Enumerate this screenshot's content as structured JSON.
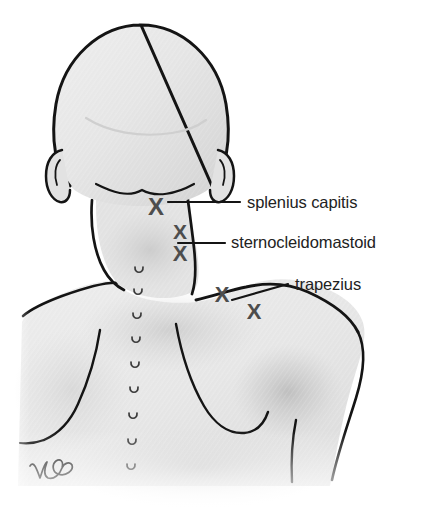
{
  "figure": {
    "view": "posterior",
    "background_color": "#ffffff",
    "skin_fill_light": "#f2f2f2",
    "skin_fill_mid": "#e4e4e4",
    "skin_fill_shadow": "#c9c9c9",
    "outline_color": "#141414",
    "marker_color": "#4d4d4d",
    "label_color": "#222222",
    "leader_color": "#141414"
  },
  "labels": [
    {
      "id": "splenius-capitis",
      "text": "splenius capitis",
      "x": 247,
      "y": 208,
      "leader": {
        "x1": 168,
        "y1": 202,
        "x2": 240,
        "y2": 202
      }
    },
    {
      "id": "sternocleidomastoid",
      "text": "sternocleidomastoid",
      "x": 231,
      "y": 248,
      "leader": {
        "x1": 178,
        "y1": 243,
        "x2": 225,
        "y2": 243
      }
    },
    {
      "id": "trapezius",
      "text": "trapezius",
      "x": 295,
      "y": 290,
      "leader": {
        "x1": 232,
        "y1": 300,
        "x2": 288,
        "y2": 284
      }
    }
  ],
  "markers": [
    {
      "id": "x-splenius-capitis",
      "label": "X",
      "x": 156,
      "y": 206,
      "size": 24
    },
    {
      "id": "x-sternocleidomastoid-upper",
      "label": "X",
      "x": 180,
      "y": 231,
      "size": 21
    },
    {
      "id": "x-sternocleidomastoid-lower",
      "label": "X",
      "x": 180,
      "y": 253,
      "size": 22
    },
    {
      "id": "x-trapezius-upper",
      "label": "X",
      "x": 222,
      "y": 294,
      "size": 22
    },
    {
      "id": "x-trapezius-lower",
      "label": "X",
      "x": 254,
      "y": 311,
      "size": 22
    }
  ],
  "spine": {
    "name": "vertebral-spinous-processes",
    "points": [
      {
        "x": 139,
        "y": 271
      },
      {
        "x": 138,
        "y": 293
      },
      {
        "x": 137,
        "y": 317
      },
      {
        "x": 136,
        "y": 341
      },
      {
        "x": 135,
        "y": 366
      },
      {
        "x": 134,
        "y": 391
      },
      {
        "x": 133,
        "y": 417
      },
      {
        "x": 132,
        "y": 443
      },
      {
        "x": 131,
        "y": 468
      }
    ]
  },
  "signature": {
    "name": "artist-signature",
    "x": 36,
    "y": 470
  }
}
